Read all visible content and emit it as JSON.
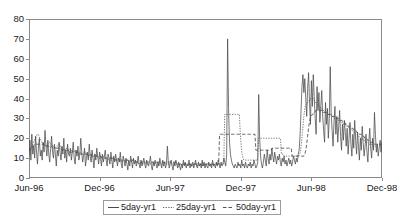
{
  "chart_data": {
    "type": "line",
    "title": "",
    "subtitle": "",
    "xlabel": "",
    "ylabel": "",
    "xlim": [
      "Jun-96",
      "Dec-98"
    ],
    "ylim": [
      0,
      80
    ],
    "ytick_step": 10,
    "yticks": [
      0,
      10,
      20,
      30,
      40,
      50,
      60,
      70,
      80
    ],
    "xticks": [
      "Jun-96",
      "Dec-96",
      "Jun-97",
      "Dec-97",
      "Jun-98",
      "Dec-98"
    ],
    "xtick_positions_fraction": [
      0.0,
      0.2,
      0.4,
      0.6,
      0.8,
      1.0
    ],
    "grid": false,
    "legend_position": "bottom-center",
    "legend_entries": [
      "5day-yr1",
      "25day-yr1",
      "50day-yr1"
    ],
    "series": [
      {
        "name": "5day-yr1",
        "style": "solid",
        "color": "#4a4a4a",
        "values": [
          11,
          19,
          9,
          22,
          12,
          16,
          10,
          21,
          13,
          7,
          15,
          20,
          11,
          14,
          9,
          18,
          13,
          24,
          16,
          11,
          19,
          12,
          8,
          15,
          21,
          13,
          10,
          17,
          12,
          6,
          14,
          11,
          18,
          13,
          9,
          16,
          12,
          20,
          10,
          14,
          8,
          17,
          12,
          11,
          15,
          9,
          13,
          18,
          10,
          7,
          14,
          11,
          16,
          9,
          12,
          20,
          13,
          8,
          11,
          15,
          6,
          10,
          13,
          9,
          17,
          11,
          8,
          14,
          10,
          5,
          12,
          9,
          15,
          11,
          7,
          13,
          10,
          6,
          12,
          8,
          11,
          14,
          9,
          6,
          12,
          10,
          7,
          13,
          9,
          5,
          11,
          8,
          12,
          9,
          6,
          10,
          8,
          13,
          7,
          5,
          11,
          9,
          6,
          10,
          7,
          4,
          9,
          6,
          11,
          8,
          5,
          10,
          7,
          9,
          6,
          8,
          11,
          7,
          5,
          9,
          6,
          8,
          10,
          7,
          5,
          9,
          7,
          6,
          8,
          11,
          6,
          4,
          8,
          6,
          9,
          7,
          5,
          8,
          6,
          10,
          7,
          5,
          9,
          6,
          8,
          5,
          7,
          16,
          8,
          5,
          7,
          9,
          6,
          4,
          8,
          6,
          9,
          7,
          5,
          8,
          6,
          4,
          7,
          5,
          9,
          6,
          8,
          5,
          7,
          6,
          9,
          5,
          7,
          6,
          8,
          5,
          7,
          9,
          6,
          5,
          8,
          6,
          7,
          5,
          9,
          6,
          8,
          5,
          7,
          6,
          5,
          8,
          6,
          7,
          5,
          9,
          6,
          7,
          5,
          8,
          6,
          9,
          7,
          5,
          8,
          6,
          7,
          10,
          8,
          6,
          12,
          70,
          35,
          18,
          12,
          9,
          7,
          6,
          5,
          7,
          6,
          5,
          8,
          6,
          7,
          5,
          9,
          6,
          7,
          5,
          8,
          6,
          5,
          7,
          6,
          8,
          5,
          7,
          6,
          9,
          7,
          5,
          6,
          8,
          42,
          20,
          11,
          7,
          5,
          8,
          12,
          9,
          6,
          14,
          10,
          7,
          12,
          9,
          15,
          11,
          8,
          13,
          10,
          7,
          11,
          9,
          12,
          8,
          6,
          10,
          8,
          11,
          7,
          9,
          6,
          8,
          10,
          7,
          9,
          6,
          8,
          11,
          9,
          7,
          10,
          8,
          12,
          14,
          22,
          34,
          46,
          52,
          43,
          50,
          40,
          31,
          45,
          53,
          38,
          27,
          49,
          36,
          52,
          41,
          30,
          22,
          46,
          34,
          43,
          28,
          36,
          44,
          31,
          24,
          18,
          38,
          27,
          35,
          20,
          30,
          56,
          33,
          24,
          16,
          28,
          36,
          22,
          31,
          18,
          26,
          34,
          21,
          14,
          27,
          19,
          29,
          23,
          16,
          25,
          12,
          20,
          28,
          17,
          11,
          22,
          15,
          29,
          19,
          12,
          23,
          16,
          9,
          20,
          14,
          26,
          18,
          11,
          16,
          22,
          13,
          8,
          18,
          25,
          15,
          10,
          20,
          14,
          33,
          22,
          13,
          17,
          11,
          15,
          19,
          13,
          18
        ]
      },
      {
        "name": "25day-yr1",
        "style": "dotted",
        "color": "#6b6b6b",
        "values": [
          13,
          14,
          15,
          16,
          17,
          18,
          19,
          20,
          21,
          22,
          22,
          21,
          20,
          19,
          18,
          18,
          17,
          17,
          16,
          16,
          17,
          17,
          18,
          18,
          17,
          17,
          16,
          16,
          15,
          15,
          16,
          16,
          17,
          17,
          16,
          16,
          15,
          15,
          14,
          14,
          15,
          15,
          14,
          14,
          13,
          13,
          14,
          14,
          13,
          13,
          14,
          14,
          13,
          13,
          12,
          12,
          13,
          13,
          12,
          12,
          12,
          13,
          13,
          12,
          12,
          11,
          11,
          12,
          12,
          11,
          11,
          11,
          12,
          12,
          11,
          11,
          10,
          10,
          11,
          11,
          10,
          10,
          11,
          11,
          10,
          10,
          9,
          9,
          10,
          10,
          9,
          9,
          10,
          10,
          9,
          9,
          9,
          10,
          10,
          9,
          9,
          8,
          8,
          9,
          9,
          8,
          8,
          9,
          9,
          8,
          8,
          8,
          9,
          9,
          8,
          8,
          8,
          8,
          8,
          8,
          7,
          7,
          8,
          8,
          7,
          7,
          8,
          8,
          7,
          7,
          7,
          7,
          7,
          7,
          8,
          8,
          7,
          7,
          7,
          8,
          8,
          7,
          7,
          7,
          7,
          7,
          7,
          8,
          8,
          7,
          7,
          7,
          7,
          7,
          7,
          7,
          7,
          7,
          7,
          7,
          7,
          7,
          7,
          6,
          6,
          7,
          7,
          7,
          7,
          7,
          7,
          7,
          7,
          7,
          7,
          7,
          7,
          6,
          6,
          6,
          7,
          7,
          7,
          7,
          6,
          6,
          7,
          7,
          7,
          7,
          6,
          6,
          7,
          7,
          7,
          7,
          7,
          7,
          6,
          6,
          7,
          7,
          7,
          7,
          7,
          7,
          7,
          7,
          7,
          7,
          7,
          7,
          7,
          7,
          32,
          32,
          32,
          32,
          32,
          32,
          32,
          32,
          32,
          32,
          32,
          32,
          32,
          32,
          32,
          32,
          32,
          23,
          16,
          12,
          10,
          9,
          9,
          9,
          9,
          9,
          9,
          9,
          9,
          9,
          9,
          9,
          9,
          9,
          9,
          9,
          9,
          20,
          20,
          20,
          20,
          20,
          20,
          20,
          20,
          20,
          20,
          20,
          20,
          20,
          20,
          20,
          20,
          20,
          20,
          20,
          20,
          20,
          20,
          20,
          20,
          20,
          12,
          12,
          12,
          11,
          11,
          11,
          11,
          11,
          11,
          11,
          11,
          11,
          11,
          11,
          11,
          11,
          11,
          11,
          11,
          11,
          12,
          14,
          18,
          23,
          28,
          33,
          36,
          37,
          38,
          38,
          39,
          39,
          40,
          40,
          40,
          40,
          39,
          38,
          38,
          37,
          37,
          36,
          36,
          35,
          35,
          34,
          34,
          34,
          33,
          33,
          33,
          32,
          32,
          32,
          32,
          31,
          31,
          31,
          30,
          30,
          30,
          30,
          29,
          29,
          29,
          28,
          28,
          28,
          27,
          27,
          27,
          26,
          26,
          26,
          25,
          25,
          24,
          24,
          24,
          23,
          23,
          22,
          22,
          22,
          21,
          21,
          20,
          20,
          20,
          19,
          19,
          19,
          18,
          18,
          18,
          18,
          17,
          17,
          17,
          17,
          16,
          16,
          16,
          16,
          16,
          17,
          17,
          17,
          17,
          17,
          18
        ]
      },
      {
        "name": "50day-yr1",
        "style": "dashed",
        "color": "#555555",
        "values": [
          14,
          14,
          15,
          15,
          16,
          16,
          17,
          17,
          17,
          17,
          17,
          17,
          17,
          17,
          17,
          17,
          17,
          16,
          16,
          16,
          16,
          16,
          16,
          16,
          16,
          16,
          15,
          15,
          15,
          15,
          15,
          15,
          15,
          15,
          15,
          15,
          14,
          14,
          14,
          14,
          14,
          14,
          14,
          14,
          14,
          13,
          13,
          13,
          13,
          13,
          13,
          13,
          13,
          13,
          13,
          12,
          12,
          12,
          12,
          12,
          12,
          12,
          12,
          12,
          12,
          12,
          12,
          12,
          12,
          11,
          11,
          11,
          11,
          11,
          11,
          11,
          11,
          11,
          11,
          11,
          10,
          10,
          10,
          10,
          10,
          10,
          10,
          10,
          10,
          10,
          10,
          10,
          10,
          10,
          10,
          9,
          9,
          9,
          9,
          9,
          9,
          9,
          9,
          9,
          9,
          9,
          9,
          9,
          9,
          9,
          9,
          9,
          9,
          9,
          9,
          9,
          9,
          9,
          8,
          8,
          8,
          8,
          8,
          8,
          8,
          8,
          8,
          8,
          8,
          8,
          8,
          8,
          8,
          8,
          8,
          8,
          8,
          8,
          8,
          8,
          8,
          8,
          8,
          8,
          8,
          8,
          8,
          8,
          8,
          8,
          8,
          8,
          8,
          8,
          8,
          8,
          8,
          8,
          8,
          8,
          8,
          8,
          8,
          7,
          7,
          7,
          7,
          7,
          7,
          7,
          7,
          7,
          7,
          7,
          7,
          7,
          7,
          7,
          7,
          7,
          7,
          7,
          7,
          7,
          7,
          7,
          7,
          7,
          7,
          7,
          7,
          7,
          7,
          7,
          7,
          7,
          7,
          7,
          7,
          7,
          7,
          7,
          7,
          7,
          7,
          7,
          7,
          7,
          7,
          7,
          22,
          22,
          22,
          22,
          22,
          22,
          22,
          22,
          22,
          22,
          22,
          22,
          22,
          22,
          22,
          22,
          22,
          22,
          22,
          22,
          22,
          22,
          22,
          22,
          22,
          22,
          22,
          22,
          22,
          22,
          22,
          22,
          22,
          22,
          22,
          22,
          22,
          22,
          22,
          22,
          14,
          14,
          14,
          14,
          14,
          14,
          14,
          14,
          14,
          14,
          14,
          14,
          14,
          14,
          14,
          14,
          14,
          14,
          15,
          15,
          15,
          15,
          15,
          15,
          15,
          15,
          15,
          15,
          15,
          15,
          15,
          15,
          15,
          15,
          15,
          15,
          15,
          15,
          15,
          15,
          11,
          11,
          11,
          11,
          11,
          11,
          11,
          11,
          11,
          11,
          11,
          11,
          11,
          11,
          12,
          14,
          17,
          21,
          25,
          28,
          30,
          31,
          32,
          32,
          33,
          33,
          34,
          34,
          34,
          34,
          34,
          34,
          34,
          34,
          33,
          33,
          33,
          33,
          33,
          32,
          32,
          32,
          32,
          32,
          31,
          31,
          31,
          31,
          31,
          30,
          30,
          30,
          30,
          29,
          29,
          29,
          28,
          28,
          28,
          27,
          27,
          27,
          26,
          26,
          26,
          25,
          25,
          25,
          24,
          24,
          24,
          23,
          23,
          23,
          22,
          22,
          22,
          21,
          21,
          21,
          20,
          20,
          20,
          19,
          19,
          19,
          18,
          18,
          18,
          18,
          17,
          17,
          17,
          17,
          17,
          17,
          17,
          17,
          17,
          17
        ]
      }
    ]
  },
  "axis": {
    "y_labels": [
      "80",
      "70",
      "60",
      "50",
      "40",
      "30",
      "20",
      "10",
      "0"
    ],
    "x_labels": [
      "Jun-96",
      "Dec-96",
      "Jun-97",
      "Dec-97",
      "Jun-98",
      "Dec-98"
    ]
  },
  "legend": {
    "items": [
      {
        "label": "5day-yr1",
        "style": "solid",
        "icon": "line-solid-icon"
      },
      {
        "label": "25day-yr1",
        "style": "dotted",
        "icon": "line-dotted-icon"
      },
      {
        "label": "50day-yr1",
        "style": "dashed",
        "icon": "line-dashed-icon"
      }
    ]
  },
  "colors": {
    "frame": "#8a8a8a",
    "series_5day": "#4a4a4a",
    "series_25day": "#6b6b6b",
    "series_50day": "#555555",
    "text": "#1a1a1a",
    "background": "#ffffff"
  }
}
